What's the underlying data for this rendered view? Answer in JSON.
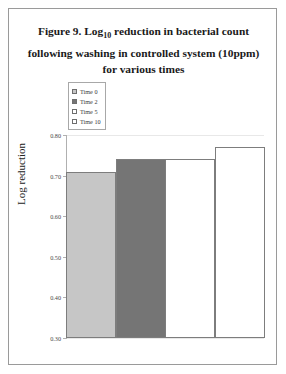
{
  "figure": {
    "caption_line1_prefix": "Figure 9. Log",
    "caption_subscript": "10",
    "caption_line1_suffix": " reduction in bacterial count",
    "caption_line2": "following washing in controlled system (10ppm)",
    "caption_line3": "for various times"
  },
  "chart_data": {
    "type": "bar",
    "title": "Figure 9. Log10 reduction in bacterial count following washing in controlled system (10ppm) for various times",
    "xlabel": "",
    "ylabel": "Log reduction",
    "categories": [
      "Time 0",
      "Time 2",
      "Time 5",
      "Time 10"
    ],
    "values": [
      0.71,
      0.74,
      0.74,
      0.77
    ],
    "ylim": [
      0.3,
      0.8
    ],
    "ytick_labels": [
      "0.80",
      "0.70",
      "0.60",
      "0.50",
      "0.40",
      "0.30"
    ],
    "ytick_values": [
      0.8,
      0.7,
      0.6,
      0.5,
      0.4,
      0.3
    ],
    "grid": true,
    "legend_position": "upper-left-inside",
    "series": [
      {
        "name": "Time 0",
        "value": 0.71,
        "color": "#c6c6c6"
      },
      {
        "name": "Time 2",
        "value": 0.74,
        "color": "#757575"
      },
      {
        "name": "Time 5",
        "value": 0.74,
        "color": "#ffffff"
      },
      {
        "name": "Time 10",
        "value": 0.77,
        "color": "#ffffff"
      }
    ]
  },
  "legend": {
    "items": [
      {
        "label": "Time 0",
        "color": "#c6c6c6"
      },
      {
        "label": "Time 2",
        "color": "#757575"
      },
      {
        "label": "Time 5",
        "color": "#ffffff"
      },
      {
        "label": "Time 10",
        "color": "#ffffff"
      }
    ]
  },
  "axis": {
    "y_title": "Log reduction"
  }
}
